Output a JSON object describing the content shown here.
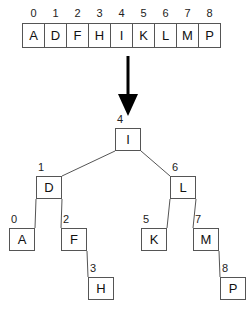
{
  "array": {
    "indices": [
      "0",
      "1",
      "2",
      "3",
      "4",
      "5",
      "6",
      "7",
      "8"
    ],
    "values": [
      "A",
      "D",
      "F",
      "H",
      "I",
      "K",
      "L",
      "M",
      "P"
    ]
  },
  "arrow": {
    "direction": "down"
  },
  "tree": {
    "nodes": [
      {
        "id": "n4",
        "label": "I",
        "index": "4",
        "x": 115,
        "y": 128,
        "index_x": 117,
        "index_y": 113
      },
      {
        "id": "n1",
        "label": "D",
        "index": "1",
        "x": 36,
        "y": 176,
        "index_x": 38,
        "index_y": 161
      },
      {
        "id": "n6",
        "label": "L",
        "index": "6",
        "x": 170,
        "y": 176,
        "index_x": 172,
        "index_y": 161
      },
      {
        "id": "n0",
        "label": "A",
        "index": "0",
        "x": 9,
        "y": 228,
        "index_x": 11,
        "index_y": 213
      },
      {
        "id": "n2",
        "label": "F",
        "index": "2",
        "x": 61,
        "y": 228,
        "index_x": 63,
        "index_y": 213
      },
      {
        "id": "n5",
        "label": "K",
        "index": "5",
        "x": 141,
        "y": 228,
        "index_x": 143,
        "index_y": 213
      },
      {
        "id": "n7",
        "label": "M",
        "index": "7",
        "x": 193,
        "y": 228,
        "index_x": 195,
        "index_y": 213
      },
      {
        "id": "n3",
        "label": "H",
        "index": "3",
        "x": 88,
        "y": 277,
        "index_x": 90,
        "index_y": 262
      },
      {
        "id": "n8",
        "label": "P",
        "index": "8",
        "x": 220,
        "y": 277,
        "index_x": 222,
        "index_y": 262
      }
    ],
    "edges": [
      {
        "from": "n4",
        "to": "n1",
        "x1": 115,
        "y1": 151,
        "x2": 62,
        "y2": 176
      },
      {
        "from": "n4",
        "to": "n6",
        "x1": 141,
        "y1": 151,
        "x2": 170,
        "y2": 176
      },
      {
        "from": "n1",
        "to": "n0",
        "x1": 36,
        "y1": 199,
        "x2": 35,
        "y2": 228
      },
      {
        "from": "n1",
        "to": "n2",
        "x1": 62,
        "y1": 199,
        "x2": 61,
        "y2": 228
      },
      {
        "from": "n6",
        "to": "n5",
        "x1": 170,
        "y1": 199,
        "x2": 167,
        "y2": 228
      },
      {
        "from": "n6",
        "to": "n7",
        "x1": 196,
        "y1": 199,
        "x2": 193,
        "y2": 228
      },
      {
        "from": "n2",
        "to": "n3",
        "x1": 87,
        "y1": 251,
        "x2": 88,
        "y2": 277
      },
      {
        "from": "n7",
        "to": "n8",
        "x1": 219,
        "y1": 251,
        "x2": 220,
        "y2": 277
      }
    ]
  },
  "colors": {
    "stroke": "#555555",
    "text": "#111111",
    "arrow": "#000000",
    "background": "#ffffff"
  }
}
